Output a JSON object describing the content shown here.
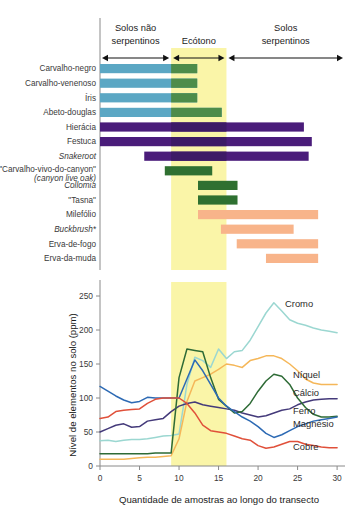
{
  "figure": {
    "zones": [
      {
        "id": "non-serpentine",
        "label_line1": "Solos não",
        "label_line2": "serpentinos",
        "x_start": 0,
        "x_end": 9
      },
      {
        "id": "ecotone",
        "label_line1": "Ecótono",
        "label_line2": "",
        "x_start": 9,
        "x_end": 16
      },
      {
        "id": "serpentine",
        "label_line1": "Solos",
        "label_line2": "serpentinos",
        "x_start": 16,
        "x_end": 31
      }
    ],
    "colors": {
      "blue_bar": "#5BA7C4",
      "green_bar": "#4D8C4A",
      "dark_green_bar": "#2F7031",
      "purple_bar": "#4A1C7A",
      "purple_bar_dark": "#3D1A66",
      "orange_bar": "#F8B48A",
      "ecotone_band": "#FAF5A8",
      "axis": "#8A8A8A",
      "cromo": "#9BD7D1",
      "niquel": "#F5B759",
      "calcio": "#443A7A",
      "ferro": "#2E6B36",
      "magnesio": "#2D6AB4",
      "cobre": "#E0503A"
    },
    "species_chart": {
      "x_min": 0,
      "x_max": 31,
      "species": [
        {
          "name": "Carvalho-negro",
          "italic": false,
          "start": 0,
          "end": 12.3,
          "color": "blue_bar",
          "overlap_color": "green_bar",
          "overlap_start": 9
        },
        {
          "name": "Carvalho-venenoso",
          "italic": false,
          "start": 0,
          "end": 12.3,
          "color": "blue_bar",
          "overlap_color": "green_bar",
          "overlap_start": 9
        },
        {
          "name": "Íris",
          "italic": false,
          "start": 0,
          "end": 12.3,
          "color": "blue_bar",
          "overlap_color": "green_bar",
          "overlap_start": 9
        },
        {
          "name": "Abeto-douglas",
          "italic": false,
          "start": 0,
          "end": 15.4,
          "color": "blue_bar",
          "overlap_color": "green_bar",
          "overlap_start": 9
        },
        {
          "name": "Hierácia",
          "italic": false,
          "start": 0,
          "end": 25.8,
          "color": "purple_bar",
          "overlap_color": "purple_bar_dark",
          "overlap_start": 9
        },
        {
          "name": "Festuca",
          "italic": false,
          "start": 0,
          "end": 26.8,
          "color": "purple_bar",
          "overlap_color": "purple_bar_dark",
          "overlap_start": 9
        },
        {
          "name": "Snakeroot",
          "italic": true,
          "start": 5.6,
          "end": 26.4,
          "color": "purple_bar",
          "overlap_color": "purple_bar_dark",
          "overlap_start": 9
        },
        {
          "name": "\"Carvalho-vivo-do-canyon\"",
          "name2": "(canyon live oak)",
          "italic": false,
          "italic2": true,
          "start": 8.2,
          "end": 14.2,
          "color": "dark_green_bar",
          "overlap_color": "dark_green_bar",
          "overlap_start": 9
        },
        {
          "name": "Collomia",
          "italic": true,
          "start": 12.4,
          "end": 17.4,
          "color": "dark_green_bar",
          "overlap_color": "dark_green_bar",
          "overlap_start": 9
        },
        {
          "name": "\"Tasna\"",
          "italic": false,
          "start": 12.4,
          "end": 17.4,
          "color": "dark_green_bar",
          "overlap_color": "dark_green_bar",
          "overlap_start": 9
        },
        {
          "name": "Milefólio",
          "italic": false,
          "start": 12.4,
          "end": 27.6,
          "color": "orange_bar",
          "overlap_color": "orange_bar",
          "overlap_start": 9
        },
        {
          "name": "Buckbrush*",
          "italic": true,
          "start": 15.3,
          "end": 24.5,
          "color": "orange_bar",
          "overlap_color": "orange_bar",
          "overlap_start": 9
        },
        {
          "name": "Erva-de-fogo",
          "italic": false,
          "start": 17.3,
          "end": 27.6,
          "color": "orange_bar",
          "overlap_color": "orange_bar",
          "overlap_start": 9
        },
        {
          "name": "Erva-da-muda",
          "italic": false,
          "start": 21.0,
          "end": 27.6,
          "color": "orange_bar",
          "overlap_color": "orange_bar",
          "overlap_start": 9
        }
      ]
    },
    "chart_data": {
      "type": "line",
      "title": "",
      "xlabel": "Quantidade de amostras ao longo do transecto",
      "ylabel": "Nível de elementos no solo (ppm)",
      "xlim": [
        0,
        31
      ],
      "ylim": [
        0,
        250
      ],
      "xticks": [
        0,
        5,
        10,
        15,
        20,
        25,
        30
      ],
      "yticks": [
        0,
        50,
        100,
        150,
        200,
        250
      ],
      "grid": false,
      "legend": "inline-right",
      "shaded_region": {
        "label": "Ecótono",
        "x_start": 9,
        "x_end": 16,
        "color": "#FAF5A8"
      },
      "x": [
        0,
        1,
        2,
        3,
        4,
        5,
        6,
        7,
        8,
        9,
        10,
        11,
        12,
        13,
        14,
        15,
        16,
        17,
        18,
        19,
        20,
        21,
        22,
        23,
        24,
        25,
        26,
        27,
        28,
        29,
        30
      ],
      "series": [
        {
          "name": "Cromo",
          "color": "#9BD7D1",
          "values": [
            37,
            38,
            36,
            38,
            39,
            39,
            40,
            42,
            44,
            45,
            47,
            120,
            160,
            155,
            145,
            172,
            158,
            168,
            170,
            185,
            205,
            225,
            240,
            228,
            215,
            210,
            207,
            203,
            200,
            198,
            196
          ]
        },
        {
          "name": "Níquel",
          "color": "#F5B759",
          "values": [
            10,
            10,
            10,
            10,
            11,
            12,
            13,
            13,
            14,
            15,
            40,
            95,
            125,
            130,
            135,
            142,
            150,
            148,
            145,
            155,
            158,
            162,
            162,
            158,
            150,
            140,
            128,
            122,
            120,
            120,
            120
          ]
        },
        {
          "name": "Cálcio",
          "color": "#443A7A",
          "values": [
            50,
            55,
            60,
            62,
            57,
            58,
            66,
            68,
            70,
            80,
            88,
            92,
            94,
            90,
            88,
            86,
            84,
            82,
            78,
            75,
            72,
            74,
            78,
            82,
            84,
            90,
            94,
            97,
            98,
            99,
            99
          ]
        },
        {
          "name": "Ferro",
          "color": "#2E6B36",
          "values": [
            18,
            18,
            18,
            18,
            18,
            18,
            18,
            19,
            19,
            19,
            130,
            172,
            170,
            168,
            130,
            98,
            88,
            78,
            80,
            92,
            110,
            125,
            135,
            132,
            120,
            100,
            86,
            76,
            72,
            72,
            73
          ]
        },
        {
          "name": "Magnésio",
          "color": "#2D6AB4",
          "values": [
            117,
            110,
            103,
            97,
            93,
            95,
            101,
            100,
            100,
            100,
            100,
            128,
            156,
            140,
            120,
            100,
            88,
            80,
            72,
            66,
            58,
            48,
            42,
            46,
            52,
            58,
            62,
            66,
            68,
            70,
            72
          ]
        },
        {
          "name": "Cobre",
          "color": "#E0503A",
          "values": [
            70,
            72,
            80,
            82,
            83,
            84,
            92,
            98,
            100,
            100,
            100,
            92,
            78,
            60,
            52,
            50,
            48,
            44,
            40,
            38,
            30,
            26,
            28,
            32,
            36,
            36,
            32,
            30,
            28,
            27,
            27
          ]
        }
      ],
      "series_label_positions": [
        {
          "name": "Cromo",
          "x": 285,
          "y": 307
        },
        {
          "name": "Níquel",
          "x": 293,
          "y": 378
        },
        {
          "name": "Cálcio",
          "x": 293,
          "y": 396
        },
        {
          "name": "Ferro",
          "x": 293,
          "y": 414
        },
        {
          "name": "Magnésio",
          "x": 293,
          "y": 427
        },
        {
          "name": "Cobre",
          "x": 293,
          "y": 450
        }
      ]
    }
  }
}
